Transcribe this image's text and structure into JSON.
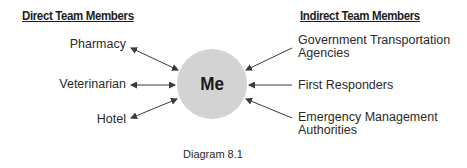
{
  "diagram": {
    "center": {
      "label": "Me",
      "fill": "#d3d3d3"
    },
    "left_group": {
      "heading": "Direct Team Members",
      "arrow_style": "double-headed",
      "items": [
        {
          "label": "Pharmacy"
        },
        {
          "label": "Veterinarian"
        },
        {
          "label": "Hotel"
        }
      ]
    },
    "right_group": {
      "heading": "Indirect Team Members",
      "arrow_style": "single-headed toward center",
      "items": [
        {
          "label_line1": "Government Transportation",
          "label_line2": "Agencies"
        },
        {
          "label_line1": "First Responders"
        },
        {
          "label_line1": "Emergency Management",
          "label_line2": "Authorities"
        }
      ]
    },
    "caption": "Diagram 8.1",
    "arrow_color": "#3a3a3a"
  }
}
